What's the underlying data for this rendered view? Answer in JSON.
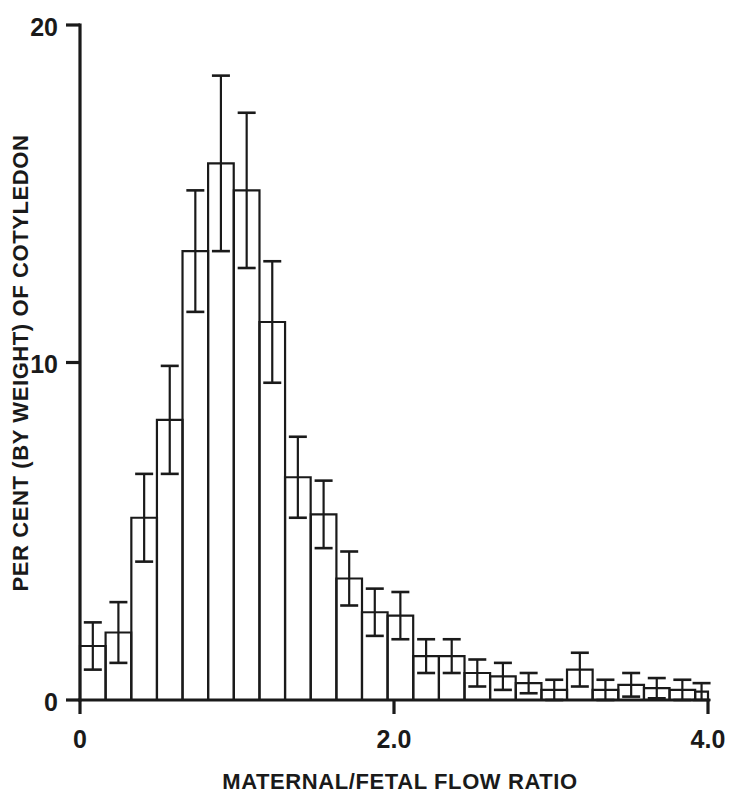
{
  "chart_data": {
    "type": "bar",
    "title": "",
    "subtitle": "",
    "xlabel": "MATERNAL/FETAL FLOW RATIO",
    "ylabel": "PER CENT (BY WEIGHT) OF COTYLEDON",
    "xlim": [
      0,
      4.0
    ],
    "ylim": [
      0,
      20
    ],
    "grid": false,
    "legend": null,
    "bin_width": 0.1632,
    "x_tick_labels": [
      "0",
      "2.0",
      "4.0"
    ],
    "x_tick_values": [
      0,
      2.0,
      4.0
    ],
    "y_tick_labels": [
      "0",
      "10",
      "20"
    ],
    "y_tick_values": [
      0,
      10,
      20
    ],
    "x_minor_ticks_count": 0,
    "categories": [
      "0.00-0.16",
      "0.16-0.33",
      "0.33-0.49",
      "0.49-0.65",
      "0.65-0.82",
      "0.82-0.98",
      "0.98-1.14",
      "1.14-1.31",
      "1.31-1.47",
      "1.47-1.63",
      "1.63-1.80",
      "1.80-1.96",
      "1.96-2.12",
      "2.12-2.29",
      "2.29-2.45",
      "2.45-2.61",
      "2.61-2.78",
      "2.78-2.94",
      "2.94-3.10",
      "3.10-3.27",
      "3.27-3.43",
      "3.43-3.59",
      "3.59-3.76",
      "3.76-3.92",
      "3.92-4.00"
    ],
    "bin_left_edges": [
      0.0,
      0.163,
      0.327,
      0.49,
      0.653,
      0.816,
      0.98,
      1.143,
      1.306,
      1.47,
      1.633,
      1.796,
      1.959,
      2.123,
      2.286,
      2.449,
      2.612,
      2.776,
      2.939,
      3.102,
      3.265,
      3.429,
      3.592,
      3.755,
      3.918
    ],
    "values": [
      1.6,
      2.0,
      5.4,
      8.3,
      13.3,
      15.9,
      15.1,
      11.2,
      6.6,
      5.5,
      3.6,
      2.6,
      2.5,
      1.3,
      1.3,
      0.8,
      0.7,
      0.5,
      0.3,
      0.9,
      0.3,
      0.45,
      0.35,
      0.3,
      0.25
    ],
    "errors_upper": [
      0.7,
      0.9,
      1.3,
      1.6,
      1.8,
      2.6,
      2.3,
      1.8,
      1.2,
      1.0,
      0.8,
      0.7,
      0.7,
      0.5,
      0.5,
      0.4,
      0.4,
      0.3,
      0.3,
      0.5,
      0.3,
      0.35,
      0.3,
      0.3,
      0.25
    ],
    "errors_lower": [
      0.7,
      0.9,
      1.3,
      1.6,
      1.8,
      2.6,
      2.3,
      1.8,
      1.2,
      1.0,
      0.8,
      0.7,
      0.7,
      0.5,
      0.5,
      0.4,
      0.4,
      0.3,
      0.3,
      0.5,
      0.3,
      0.35,
      0.3,
      0.3,
      0.25
    ],
    "series": [
      {
        "name": "Per cent of cotyledon",
        "values": [
          1.6,
          2.0,
          5.4,
          8.3,
          13.3,
          15.9,
          15.1,
          11.2,
          6.6,
          5.5,
          3.6,
          2.6,
          2.5,
          1.3,
          1.3,
          0.8,
          0.7,
          0.5,
          0.3,
          0.9,
          0.3,
          0.45,
          0.35,
          0.3,
          0.25
        ]
      }
    ],
    "error_bar_style": "symmetric-capped",
    "colors": {
      "ink": "#1a1a1a",
      "background": "#ffffff",
      "bar_fill": "none",
      "bar_stroke": "#1a1a1a"
    }
  }
}
